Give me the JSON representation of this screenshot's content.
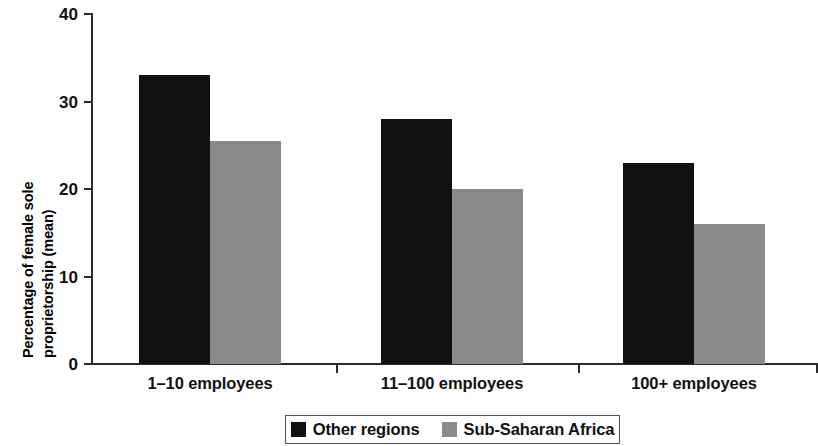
{
  "chart_data": {
    "type": "bar",
    "title": "",
    "subtitle": "",
    "xlabel": "",
    "ylabel": "Percentage of female sole proprietorship (mean)",
    "ylabel_lines": [
      "Percentage of female sole",
      "proprietorship (mean)"
    ],
    "categories": [
      "1–10 employees",
      "11–100 employees",
      "100+ employees"
    ],
    "series": [
      {
        "name": "Other regions",
        "color": "#111111",
        "values": [
          33,
          28,
          23
        ]
      },
      {
        "name": "Sub-Saharan Africa",
        "color": "#8a8a8a",
        "values": [
          25.5,
          20,
          16
        ]
      }
    ],
    "ylim": [
      0,
      40
    ],
    "ytick_labels": [
      "0",
      "10",
      "20",
      "30",
      "40"
    ],
    "ytick_values": [
      0,
      10,
      20,
      30,
      40
    ],
    "grid": false,
    "legend_position": "bottom",
    "legend_border": true
  },
  "legend": {
    "items": [
      {
        "label": "Other regions",
        "swatch": "dark-square-swatch"
      },
      {
        "label": "Sub-Saharan Africa",
        "swatch": "gray-square-swatch"
      }
    ]
  }
}
